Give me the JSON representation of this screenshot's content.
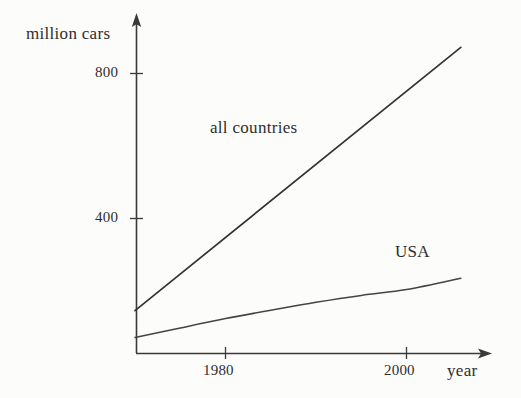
{
  "chart_data": {
    "type": "line",
    "title": "",
    "subtitle": "",
    "xlabel": "year",
    "ylabel": "million cars",
    "xlim": [
      1970,
      2009
    ],
    "ylim": [
      0,
      930
    ],
    "grid": false,
    "legend": "inline-annotations",
    "x_ticks": [
      "1980",
      "2000"
    ],
    "x_tick_values": [
      1980,
      2000
    ],
    "y_ticks": [
      "800",
      "400"
    ],
    "y_tick_values": [
      800,
      400
    ],
    "axis_style": "arrow-ended axes, no box, no gridlines",
    "series": [
      {
        "name": "all countries",
        "label": "all countries",
        "style": "straight line",
        "color": "#333333",
        "x": [
          1970,
          1975,
          1980,
          1985,
          1990,
          1995,
          2000,
          2006
        ],
        "values": [
          146,
          247,
          348,
          448,
          549,
          650,
          751,
          872
        ]
      },
      {
        "name": "USA",
        "label": "USA",
        "style": "concave rising curve",
        "color": "#444444",
        "x": [
          1970,
          1975,
          1980,
          1985,
          1990,
          1995,
          2000,
          2006
        ],
        "values": [
          72,
          98,
          124,
          147,
          169,
          188,
          204,
          235
        ]
      }
    ],
    "annotations": [
      {
        "text": "all countries",
        "series": "all countries"
      },
      {
        "text": "USA",
        "series": "USA"
      }
    ]
  },
  "axes": {
    "y_title": "million cars",
    "x_title": "year",
    "y_tick_800": "800",
    "y_tick_400": "400",
    "x_tick_1980": "1980",
    "x_tick_2000": "2000"
  },
  "labels": {
    "all_countries": "all countries",
    "usa": "USA"
  },
  "colors": {
    "background": "#fcfcfb",
    "axis": "#3a3a3a",
    "line_all_countries": "#333333",
    "line_usa": "#444444",
    "text": "#2e2e2e"
  }
}
